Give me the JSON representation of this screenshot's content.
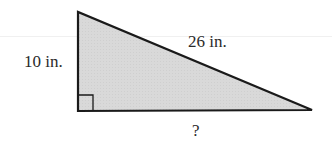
{
  "diagram": {
    "type": "right-triangle",
    "fill_color": "#d8d8d8",
    "stroke_color": "#1a1a1a",
    "vertices": {
      "top": [
        78,
        12
      ],
      "right_angle": [
        78,
        111
      ],
      "right": [
        312,
        110
      ]
    },
    "right_angle_marker": true,
    "labels": {
      "vertical_leg": "10 in.",
      "hypotenuse": "26 in.",
      "horizontal_leg": "?"
    }
  }
}
